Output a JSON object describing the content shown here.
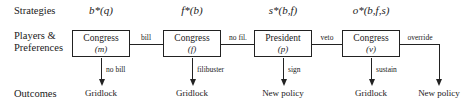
{
  "diagram": {
    "type": "extensive-form-game-tree",
    "row_labels": {
      "strategies": "Strategies",
      "players": "Players &\nPreferences",
      "players_line1": "Players &",
      "players_line2": "Preferences",
      "outcomes": "Outcomes"
    },
    "strategies": [
      {
        "label": "b*(q)",
        "x": 101
      },
      {
        "label": "f*(b)",
        "x": 192
      },
      {
        "label": "s*(b,f)",
        "x": 283
      },
      {
        "label": "o*(b,f,s)",
        "x": 371
      }
    ],
    "nodes": [
      {
        "name": "Congress",
        "param": "(m)",
        "x": 101
      },
      {
        "name": "Congress",
        "param": "(f)",
        "x": 192
      },
      {
        "name": "President",
        "param": "(p)",
        "x": 283
      },
      {
        "name": "Congress",
        "param": "(v)",
        "x": 371
      }
    ],
    "edges": [
      {
        "label": "bill",
        "x": 146,
        "left": 130,
        "width": 33
      },
      {
        "label": "no fil.",
        "x": 238,
        "left": 221,
        "width": 33
      },
      {
        "label": "veto",
        "x": 327,
        "left": 312,
        "width": 30
      }
    ],
    "branches": [
      {
        "label": "no bill",
        "outcome": "Gridlock",
        "x": 101
      },
      {
        "label": "filibuster",
        "outcome": "Gridlock",
        "x": 192
      },
      {
        "label": "sign",
        "outcome": "New policy",
        "x": 283
      },
      {
        "label": "sustain",
        "outcome": "Gridlock",
        "x": 371
      }
    ],
    "override": {
      "label": "override",
      "label_x": 420,
      "outcome": "New policy",
      "outcome_x": 439
    },
    "colors": {
      "line": "#222222",
      "text": "#1a1a1a",
      "background": "#ffffff"
    }
  }
}
